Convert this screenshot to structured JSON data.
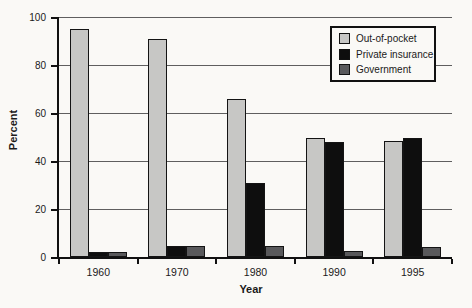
{
  "chart_data": {
    "type": "bar",
    "title": "",
    "xlabel": "Year",
    "ylabel": "Percent",
    "ylim": [
      0,
      100
    ],
    "yticks": [
      0,
      20,
      40,
      60,
      80,
      100
    ],
    "grid": true,
    "legend_position": "top-right",
    "categories": [
      "1960",
      "1970",
      "1980",
      "1990",
      "1995"
    ],
    "series": [
      {
        "name": "Out-of-pocket",
        "color": "#c7c7c5",
        "values": [
          95,
          91,
          66,
          49.5,
          48.5
        ]
      },
      {
        "name": "Private insurance",
        "color": "#0e0e0e",
        "values": [
          2,
          4.5,
          31,
          48,
          49.5
        ]
      },
      {
        "name": "Government",
        "color": "#59595b",
        "values": [
          2,
          4.5,
          4.5,
          2.5,
          4
        ]
      }
    ]
  },
  "style": {
    "background": "#faf9f6",
    "gridline_color": "#5f5f5f",
    "axis_color": "#111111",
    "bar_border_color": "#141414"
  }
}
